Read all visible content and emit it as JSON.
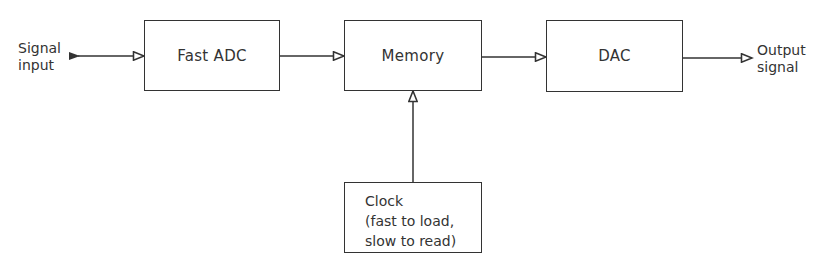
{
  "diagram": {
    "type": "block-diagram",
    "input": {
      "lines": [
        "Signal",
        "input"
      ]
    },
    "output": {
      "lines": [
        "Output",
        "signal"
      ]
    },
    "blocks": [
      {
        "id": "fast-adc",
        "label": "Fast ADC"
      },
      {
        "id": "memory",
        "label": "Memory"
      },
      {
        "id": "dac",
        "label": "DAC"
      },
      {
        "id": "clock",
        "lines": [
          "Clock",
          "(fast to load,",
          "slow to read)"
        ]
      }
    ],
    "connections": [
      {
        "from": "Signal input",
        "to": "Fast ADC"
      },
      {
        "from": "Fast ADC",
        "to": "Memory"
      },
      {
        "from": "Memory",
        "to": "DAC"
      },
      {
        "from": "DAC",
        "to": "Output signal"
      },
      {
        "from": "Clock",
        "to": "Memory"
      }
    ],
    "colors": {
      "line": "#333333",
      "background": "#ffffff"
    }
  }
}
